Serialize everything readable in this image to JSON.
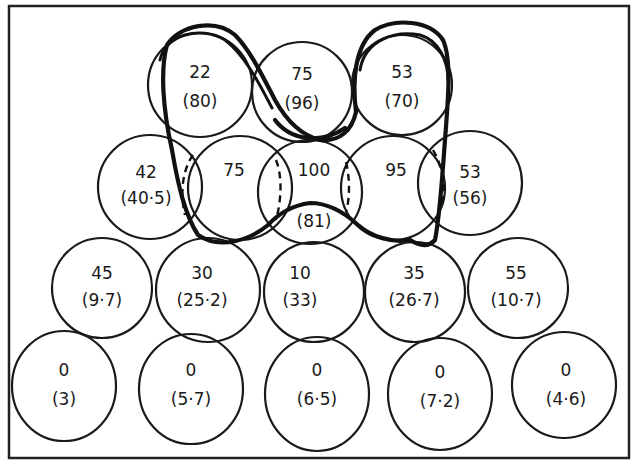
{
  "diagram": {
    "rows": [
      {
        "row": 1,
        "cells": [
          {
            "value": "22",
            "paren": "(80)"
          },
          {
            "value": "75",
            "paren": "(96)"
          },
          {
            "value": "53",
            "paren": "(70)"
          }
        ]
      },
      {
        "row": 2,
        "cells": [
          {
            "value": "42",
            "paren": "(40·5)"
          },
          {
            "value": "75",
            "paren": ""
          },
          {
            "value": "100",
            "paren": "(81)"
          },
          {
            "value": "95",
            "paren": ""
          },
          {
            "value": "53",
            "paren": "(56)"
          }
        ]
      },
      {
        "row": 3,
        "cells": [
          {
            "value": "45",
            "paren": "(9·7)"
          },
          {
            "value": "30",
            "paren": "(25·2)"
          },
          {
            "value": "10",
            "paren": "(33)"
          },
          {
            "value": "35",
            "paren": "(26·7)"
          },
          {
            "value": "55",
            "paren": "(10·7)"
          }
        ]
      },
      {
        "row": 4,
        "cells": [
          {
            "value": "0",
            "paren": "(3)"
          },
          {
            "value": "0",
            "paren": "(5·7)"
          },
          {
            "value": "0",
            "paren": "(6·5)"
          },
          {
            "value": "0",
            "paren": "(7·2)"
          },
          {
            "value": "0",
            "paren": "(4·6)"
          }
        ]
      }
    ],
    "colors": {
      "ink": "#1a1a1a",
      "background": "#ffffff"
    }
  }
}
